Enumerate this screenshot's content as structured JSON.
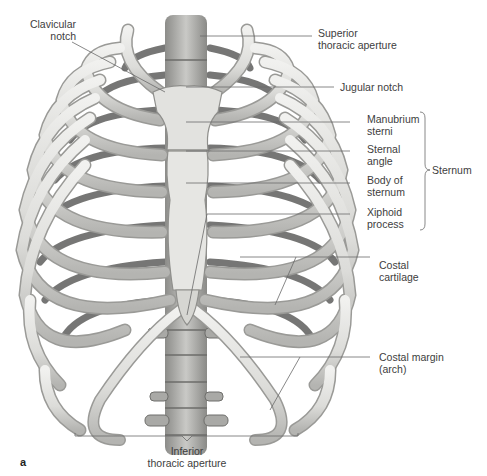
{
  "figure": {
    "panel_letter": "a",
    "colors": {
      "bone": "#e4e4e2",
      "bone_shade": "#b9b9b6",
      "bone_dark": "#7d7d7a",
      "rib_back": "#5e5e5c",
      "leader": "#6a6a6a",
      "text": "#3d3d3d"
    }
  },
  "labels": {
    "clavicular_notch": {
      "line1": "Clavicular",
      "line2": "notch"
    },
    "superior_thoracic_aperture": {
      "line1": "Superior",
      "line2": "thoracic aperture"
    },
    "jugular_notch": {
      "line1": "Jugular notch"
    },
    "manubrium_sterni": {
      "line1": "Manubrium",
      "line2": "sterni"
    },
    "sternal_angle": {
      "line1": "Sternal",
      "line2": "angle"
    },
    "body_of_sternum": {
      "line1": "Body of",
      "line2": "sternum"
    },
    "xiphoid_process": {
      "line1": "Xiphoid",
      "line2": "process"
    },
    "sternum_group": {
      "line1": "Sternum"
    },
    "costal_cartilage": {
      "line1": "Costal",
      "line2": "cartilage"
    },
    "costal_margin": {
      "line1": "Costal margin",
      "line2": "(arch)"
    },
    "inferior_thoracic_aperture": {
      "line1": "Inferior",
      "line2": "thoracic aperture"
    }
  }
}
